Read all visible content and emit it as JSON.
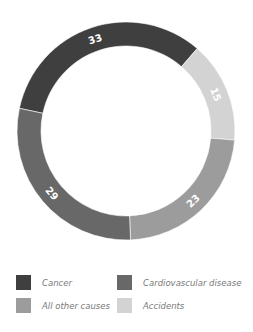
{
  "chart_data": {
    "type": "pie",
    "variant": "donut",
    "title": "",
    "unit": "%",
    "start_angle_deg": 282,
    "direction": "clockwise",
    "categories": [
      "Cancer",
      "Accidents",
      "All other causes",
      "Cardiovascular disease"
    ],
    "values": [
      33,
      15,
      23,
      29
    ],
    "colors": [
      "#3f3f3f",
      "#d3d3d3",
      "#9c9c9c",
      "#686868"
    ],
    "label_color": "#ffffff",
    "legend_position": "bottom",
    "legend_order": [
      "Cancer",
      "Cardiovascular disease",
      "All other causes",
      "Accidents"
    ]
  },
  "legend": {
    "items": [
      {
        "label": "Cancer",
        "color": "#3f3f3f"
      },
      {
        "label": "Cardiovascular disease",
        "color": "#686868"
      },
      {
        "label": "All other causes",
        "color": "#9c9c9c"
      },
      {
        "label": "Accidents",
        "color": "#d3d3d3"
      }
    ]
  }
}
